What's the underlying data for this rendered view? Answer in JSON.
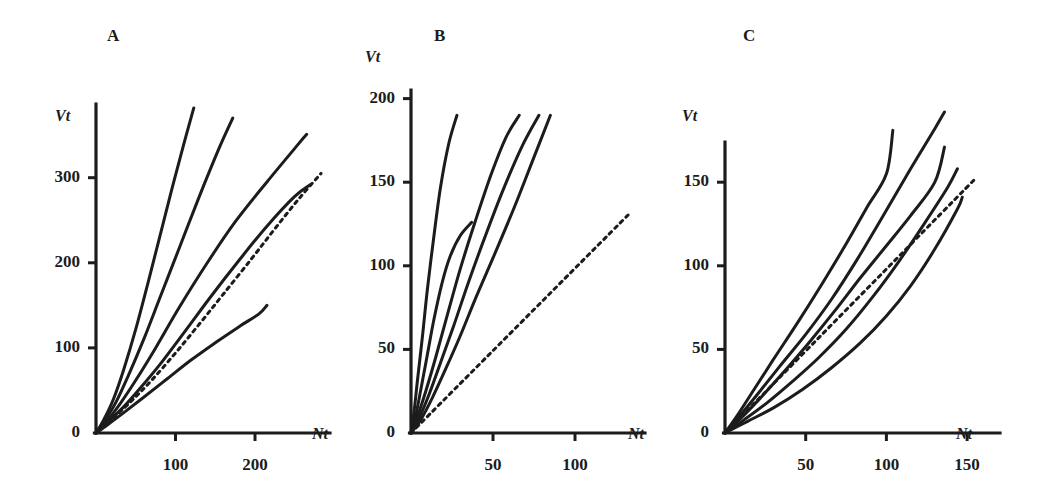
{
  "figure": {
    "width": 1053,
    "height": 493,
    "background": "#ffffff",
    "ink_color": "#1c1c1c"
  },
  "chart_data": [
    {
      "type": "line",
      "panel": "A",
      "title": "A",
      "xlabel": "Nt",
      "ylabel": "Vt",
      "xlim": [
        0,
        290
      ],
      "ylim": [
        0,
        390
      ],
      "xticks": [
        100,
        200
      ],
      "xtick_labels": [
        "100",
        "200"
      ],
      "yticks": [
        0,
        100,
        200,
        300
      ],
      "ytick_labels": [
        "0",
        "100",
        "200",
        "300"
      ],
      "grid": false,
      "legend": "none",
      "plot_px": {
        "x0": 96,
        "y0": 433,
        "x_per_unit": 0.795,
        "y_per_unit": 0.851,
        "axis_top": 104,
        "axis_right": 330
      },
      "series": [
        {
          "name": "curve-1",
          "style": "solid",
          "points": [
            [
              0,
              0
            ],
            [
              10,
              16
            ],
            [
              22,
              40
            ],
            [
              35,
              75
            ],
            [
              50,
              122
            ],
            [
              65,
              175
            ],
            [
              80,
              230
            ],
            [
              95,
              285
            ],
            [
              110,
              338
            ],
            [
              123,
              382
            ]
          ]
        },
        {
          "name": "curve-2",
          "style": "solid",
          "points": [
            [
              0,
              0
            ],
            [
              10,
              13
            ],
            [
              25,
              36
            ],
            [
              40,
              66
            ],
            [
              60,
              110
            ],
            [
              80,
              158
            ],
            [
              105,
              218
            ],
            [
              130,
              278
            ],
            [
              155,
              335
            ],
            [
              172,
              370
            ]
          ]
        },
        {
          "name": "curve-3",
          "style": "solid",
          "points": [
            [
              0,
              0
            ],
            [
              12,
              12
            ],
            [
              30,
              34
            ],
            [
              50,
              62
            ],
            [
              75,
              100
            ],
            [
              105,
              148
            ],
            [
              140,
              200
            ],
            [
              175,
              248
            ],
            [
              215,
              295
            ],
            [
              255,
              340
            ],
            [
              265,
              351
            ]
          ]
        },
        {
          "name": "curve-4",
          "style": "solid",
          "points": [
            [
              0,
              0
            ],
            [
              15,
              13
            ],
            [
              35,
              31
            ],
            [
              55,
              52
            ],
            [
              80,
              80
            ],
            [
              110,
              117
            ],
            [
              145,
              161
            ],
            [
              180,
              203
            ],
            [
              215,
              243
            ],
            [
              250,
              278
            ],
            [
              270,
              292
            ]
          ]
        },
        {
          "name": "curve-5-dashed",
          "style": "dashed",
          "points": [
            [
              0,
              0
            ],
            [
              20,
              16
            ],
            [
              45,
              38
            ],
            [
              70,
              62
            ],
            [
              100,
              94
            ],
            [
              130,
              128
            ],
            [
              160,
              163
            ],
            [
              195,
              204
            ],
            [
              225,
              240
            ],
            [
              255,
              275
            ],
            [
              283,
              305
            ]
          ]
        },
        {
          "name": "curve-6",
          "style": "solid",
          "points": [
            [
              0,
              0
            ],
            [
              15,
              10
            ],
            [
              35,
              24
            ],
            [
              60,
              42
            ],
            [
              90,
              64
            ],
            [
              120,
              86
            ],
            [
              150,
              106
            ],
            [
              180,
              125
            ],
            [
              205,
              140
            ],
            [
              215,
              150
            ]
          ]
        }
      ]
    },
    {
      "type": "line",
      "panel": "B",
      "title": "B",
      "xlabel": "Nt",
      "ylabel": "Vt",
      "xlim": [
        0,
        130
      ],
      "ylim": [
        0,
        225
      ],
      "xticks": [
        50,
        100
      ],
      "xtick_labels": [
        "50",
        "100"
      ],
      "yticks": [
        0,
        50,
        100,
        150,
        200
      ],
      "ytick_labels": [
        "0",
        "50",
        "100",
        "150",
        "200"
      ],
      "grid": false,
      "legend": "none",
      "plot_px": {
        "x0": 411,
        "y0": 433,
        "x_per_unit": 1.64,
        "y_per_unit": 1.672,
        "axis_top": 90,
        "axis_right": 645
      },
      "series": [
        {
          "name": "curve-1",
          "style": "solid",
          "points": [
            [
              0,
              0
            ],
            [
              2,
              14
            ],
            [
              4,
              32
            ],
            [
              7,
              58
            ],
            [
              10,
              86
            ],
            [
              14,
              118
            ],
            [
              18,
              147
            ],
            [
              23,
              173
            ],
            [
              28,
              190
            ]
          ]
        },
        {
          "name": "curve-2",
          "style": "solid",
          "points": [
            [
              0,
              0
            ],
            [
              3,
              11
            ],
            [
              6,
              26
            ],
            [
              10,
              47
            ],
            [
              14,
              68
            ],
            [
              19,
              90
            ],
            [
              24,
              106
            ],
            [
              30,
              118
            ],
            [
              37,
              126
            ]
          ]
        },
        {
          "name": "curve-3",
          "style": "solid",
          "points": [
            [
              0,
              0
            ],
            [
              4,
              10
            ],
            [
              9,
              25
            ],
            [
              15,
              45
            ],
            [
              22,
              70
            ],
            [
              30,
              98
            ],
            [
              39,
              126
            ],
            [
              49,
              155
            ],
            [
              58,
              177
            ],
            [
              66,
              190
            ]
          ]
        },
        {
          "name": "curve-4",
          "style": "solid",
          "points": [
            [
              0,
              0
            ],
            [
              5,
              9
            ],
            [
              11,
              23
            ],
            [
              18,
              42
            ],
            [
              26,
              64
            ],
            [
              35,
              90
            ],
            [
              45,
              117
            ],
            [
              56,
              145
            ],
            [
              68,
              172
            ],
            [
              78,
              190
            ]
          ]
        },
        {
          "name": "curve-5",
          "style": "solid",
          "points": [
            [
              0,
              0
            ],
            [
              6,
              8
            ],
            [
              13,
              21
            ],
            [
              21,
              38
            ],
            [
              30,
              58
            ],
            [
              40,
              82
            ],
            [
              51,
              107
            ],
            [
              63,
              135
            ],
            [
              75,
              165
            ],
            [
              85,
              190
            ]
          ]
        },
        {
          "name": "curve-6-dashed",
          "style": "dashed",
          "points": [
            [
              0,
              0
            ],
            [
              133,
              131
            ]
          ]
        }
      ]
    },
    {
      "type": "line",
      "panel": "C",
      "title": "C",
      "xlabel": "Nt",
      "ylabel": "Vt",
      "xlim": [
        0,
        170
      ],
      "ylim": [
        0,
        205
      ],
      "xticks": [
        50,
        100,
        150
      ],
      "xtick_labels": [
        "50",
        "100",
        "150"
      ],
      "yticks": [
        0,
        50,
        100,
        150
      ],
      "ytick_labels": [
        "0",
        "50",
        "100",
        "150"
      ],
      "grid": false,
      "legend": "none",
      "plot_px": {
        "x0": 725,
        "y0": 433,
        "x_per_unit": 1.614,
        "y_per_unit": 1.672,
        "axis_top": 142,
        "axis_right": 1000
      },
      "series": [
        {
          "name": "curve-1",
          "style": "solid",
          "points": [
            [
              0,
              0
            ],
            [
              8,
              11
            ],
            [
              18,
              26
            ],
            [
              30,
              44
            ],
            [
              45,
              66
            ],
            [
              60,
              89
            ],
            [
              75,
              113
            ],
            [
              88,
              135
            ],
            [
              100,
              155
            ],
            [
              104,
              181
            ]
          ]
        },
        {
          "name": "curve-2",
          "style": "solid",
          "points": [
            [
              0,
              0
            ],
            [
              9,
              10
            ],
            [
              20,
              23
            ],
            [
              34,
              40
            ],
            [
              50,
              59
            ],
            [
              66,
              80
            ],
            [
              82,
              104
            ],
            [
              98,
              130
            ],
            [
              115,
              158
            ],
            [
              130,
              182
            ],
            [
              136,
              192
            ]
          ]
        },
        {
          "name": "curve-3",
          "style": "solid",
          "points": [
            [
              0,
              0
            ],
            [
              10,
              9
            ],
            [
              22,
              21
            ],
            [
              36,
              36
            ],
            [
              52,
              54
            ],
            [
              68,
              73
            ],
            [
              84,
              93
            ],
            [
              100,
              112
            ],
            [
              115,
              130
            ],
            [
              130,
              150
            ],
            [
              136,
              171
            ]
          ]
        },
        {
          "name": "curve-4-dashed",
          "style": "dashed",
          "points": [
            [
              0,
              0
            ],
            [
              155,
              152
            ]
          ]
        },
        {
          "name": "curve-5",
          "style": "solid",
          "points": [
            [
              0,
              0
            ],
            [
              12,
              8
            ],
            [
              26,
              18
            ],
            [
              42,
              31
            ],
            [
              58,
              45
            ],
            [
              75,
              62
            ],
            [
              92,
              82
            ],
            [
              108,
              103
            ],
            [
              124,
              126
            ],
            [
              138,
              147
            ],
            [
              144,
              158
            ]
          ]
        },
        {
          "name": "curve-6",
          "style": "solid",
          "points": [
            [
              0,
              0
            ],
            [
              14,
              7
            ],
            [
              30,
              15
            ],
            [
              48,
              26
            ],
            [
              66,
              39
            ],
            [
              84,
              54
            ],
            [
              100,
              70
            ],
            [
              115,
              88
            ],
            [
              130,
              110
            ],
            [
              144,
              134
            ],
            [
              147,
              141
            ]
          ]
        }
      ]
    }
  ]
}
